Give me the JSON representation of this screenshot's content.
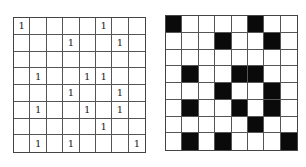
{
  "left_grid": {
    "rows": 8,
    "cols": 8,
    "symbol": "1",
    "cells": [
      [
        "1",
        "",
        "",
        "",
        "",
        "1",
        "",
        ""
      ],
      [
        "",
        "",
        "",
        "1",
        "",
        "",
        "1",
        ""
      ],
      [
        "",
        "",
        "",
        "",
        "",
        "",
        "",
        ""
      ],
      [
        "",
        "1",
        "",
        "",
        "1",
        "1",
        "",
        ""
      ],
      [
        "",
        "",
        "",
        "1",
        "",
        "",
        "1",
        ""
      ],
      [
        "",
        "1",
        "",
        "",
        "1",
        "",
        "1",
        ""
      ],
      [
        "",
        "",
        "",
        "",
        "",
        "1",
        "",
        ""
      ],
      [
        "",
        "1",
        "",
        "1",
        "",
        "",
        "",
        "1"
      ]
    ]
  },
  "right_grid": {
    "rows": 8,
    "cols": 8,
    "fill_color": "#0a0a0a",
    "empty_color": "#ffffff",
    "cells": [
      [
        1,
        0,
        0,
        0,
        0,
        1,
        0,
        0
      ],
      [
        0,
        0,
        0,
        1,
        0,
        0,
        1,
        0
      ],
      [
        0,
        0,
        0,
        0,
        0,
        0,
        0,
        0
      ],
      [
        0,
        1,
        0,
        0,
        1,
        1,
        0,
        0
      ],
      [
        0,
        0,
        0,
        1,
        0,
        0,
        1,
        0
      ],
      [
        0,
        1,
        0,
        0,
        1,
        0,
        1,
        0
      ],
      [
        0,
        0,
        0,
        0,
        0,
        1,
        0,
        0
      ],
      [
        0,
        1,
        0,
        1,
        0,
        0,
        0,
        1
      ]
    ]
  }
}
